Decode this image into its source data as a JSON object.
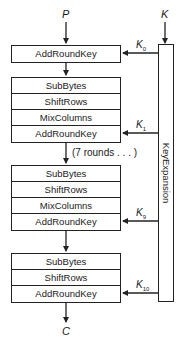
{
  "diagram": {
    "inputs": {
      "plaintext": "P",
      "key": "K"
    },
    "output": {
      "ciphertext": "C"
    },
    "initial_round": {
      "steps": [
        "AddRoundKey"
      ],
      "key": {
        "base": "K",
        "sub": "0"
      }
    },
    "round_1": {
      "steps": [
        "SubBytes",
        "ShiftRows",
        "MixColumns",
        "AddRoundKey"
      ],
      "key": {
        "base": "K",
        "sub": "1"
      }
    },
    "repeat_note": "(7 rounds . . . )",
    "round_9": {
      "steps": [
        "SubBytes",
        "ShiftRows",
        "MixColumns",
        "AddRoundKey"
      ],
      "key": {
        "base": "K",
        "sub": "9"
      }
    },
    "final_round": {
      "steps": [
        "SubBytes",
        "ShiftRows",
        "AddRoundKey"
      ],
      "key": {
        "base": "K",
        "sub": "10"
      }
    },
    "key_expansion_label": "KeyExpansion"
  }
}
